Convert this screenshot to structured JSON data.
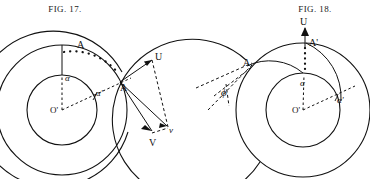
{
  "page": {
    "width": 370,
    "height": 179,
    "background": "#ffffff",
    "ink": "#111111"
  },
  "figures": [
    {
      "id": "fig-17",
      "caption_prefix": "F",
      "caption_smallcaps": "IG",
      "caption_suffix": ". 17.",
      "caption_full": "FIG. 17.",
      "caption_x": 65,
      "caption_y": 5,
      "center": {
        "x": 62,
        "y": 110,
        "label": "O'"
      },
      "circles": {
        "inner_radius": 35,
        "outer_radius": 65,
        "spiral_outer_radius": 78
      },
      "labels": {
        "A_top": "A",
        "A_right": "A",
        "alpha": "α",
        "alpha_prime": "α'",
        "origin": "O'",
        "U": "U",
        "V_upper": "v",
        "V_lower": "V"
      },
      "vectors": [
        {
          "name": "U",
          "kind": "solid-arrow"
        },
        {
          "name": "V",
          "kind": "solid-arrow"
        },
        {
          "name": "v",
          "kind": "dashed-arrow"
        }
      ]
    },
    {
      "id": "fig-18",
      "caption_prefix": "F",
      "caption_smallcaps": "IG",
      "caption_suffix": ". 18.",
      "caption_full": "FIG. 18.",
      "caption_x": 315,
      "caption_y": 5,
      "center": {
        "x": 303,
        "y": 110,
        "label": "O'"
      },
      "circles": {
        "inner_radius": 37,
        "outer_radius": 67,
        "spiral_outer_radius": 80
      },
      "labels": {
        "A_prime": "A'",
        "A_left": "A",
        "alpha": "α",
        "alpha_prime": "α'",
        "origin": "O'",
        "phi": "ϕ",
        "U": "U"
      },
      "vectors": [
        {
          "name": "U",
          "kind": "solid-arrow"
        }
      ]
    }
  ]
}
